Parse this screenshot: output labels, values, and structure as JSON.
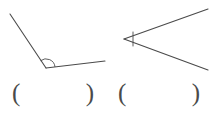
{
  "page": {
    "background_color": "#ffffff",
    "width": 217,
    "height": 113
  },
  "style": {
    "stroke_color": "#4a4a4a",
    "stroke_width": 1,
    "paren_color": "#4a4a4a"
  },
  "figures": [
    {
      "id": "figure-1",
      "name": "obtuse-angle-figure",
      "angle_type": "obtuse",
      "vertex": {
        "x": 46,
        "y": 68
      },
      "rays": [
        {
          "name": "ray-up-left",
          "from": {
            "x": 46,
            "y": 68
          },
          "to": {
            "x": 10,
            "y": 14
          }
        },
        {
          "name": "ray-right",
          "from": {
            "x": 46,
            "y": 68
          },
          "to": {
            "x": 105,
            "y": 61
          }
        }
      ],
      "marker": {
        "type": "arc",
        "name": "angle-arc-marker",
        "radius": 9
      }
    },
    {
      "id": "figure-2",
      "name": "acute-angle-figure",
      "angle_type": "acute",
      "vertex": {
        "x": 124,
        "y": 39
      },
      "rays": [
        {
          "name": "ray-upper-right",
          "from": {
            "x": 124,
            "y": 39
          },
          "to": {
            "x": 208,
            "y": 9
          }
        },
        {
          "name": "ray-lower-right",
          "from": {
            "x": 124,
            "y": 39
          },
          "to": {
            "x": 208,
            "y": 70
          }
        }
      ],
      "marker": {
        "type": "segment",
        "name": "angle-segment-marker",
        "from": {
          "x": 133,
          "y": 32
        },
        "to": {
          "x": 133,
          "y": 46
        }
      }
    }
  ],
  "answers": [
    {
      "id": "answer-1",
      "name": "answer-blank-left",
      "open_paren": "(",
      "close_paren": ")",
      "value": ""
    },
    {
      "id": "answer-2",
      "name": "answer-blank-right",
      "open_paren": "(",
      "close_paren": ")",
      "value": ""
    }
  ]
}
